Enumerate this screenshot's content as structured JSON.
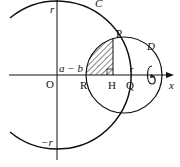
{
  "diagram": {
    "labels": {
      "origin": "O",
      "circle_c": "C",
      "circle_d": "D",
      "point_p": "P",
      "point_r": "R",
      "point_h": "H",
      "point_q": "Q",
      "axis_x": "x",
      "r_top": "r",
      "r_bottom": "−r",
      "r_right": "r",
      "a_minus_b": "a − b"
    },
    "colors": {
      "stroke": "#111111",
      "background": "#ffffff"
    }
  }
}
